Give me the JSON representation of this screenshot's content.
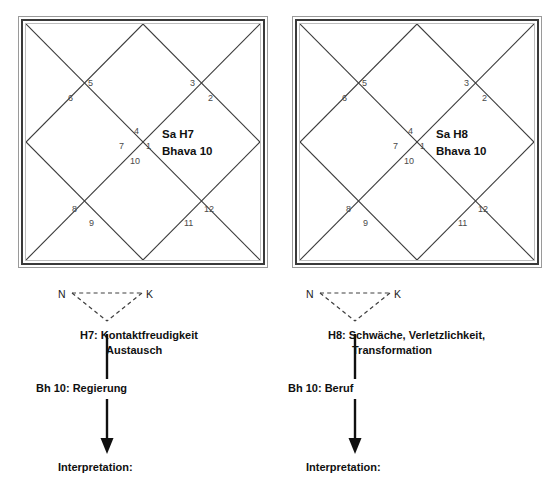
{
  "charts": [
    {
      "id": "chart-sa-h7",
      "planet_line1": "Sa H7",
      "planet_line2": "Bhava 10",
      "house_numbers": {
        "top_center_upper": "4",
        "center_left": "7",
        "center_right": "1",
        "center_lower": "10",
        "upper_left_inner": "5",
        "upper_left_outer": "6",
        "upper_right_inner": "3",
        "upper_right_outer": "2",
        "lower_left_outer": "8",
        "lower_left_inner": "9",
        "lower_right_inner": "11",
        "lower_right_outer": "12"
      }
    },
    {
      "id": "chart-sa-h8",
      "planet_line1": "Sa H8",
      "planet_line2": "Bhava 10",
      "house_numbers": {
        "top_center_upper": "4",
        "center_left": "7",
        "center_right": "1",
        "center_lower": "10",
        "upper_left_inner": "5",
        "upper_left_outer": "6",
        "upper_right_inner": "3",
        "upper_right_outer": "2",
        "lower_left_outer": "8",
        "lower_left_inner": "9",
        "lower_right_inner": "11",
        "lower_right_outer": "12"
      }
    }
  ],
  "flows": [
    {
      "id": "flow-h7",
      "node_left": "N",
      "node_right": "K",
      "house_line1": "H7: Kontaktfreudigkeit",
      "house_line2": "Austausch",
      "bhava": "Bh 10: Regierung",
      "interpretation": "Interpretation:"
    },
    {
      "id": "flow-h8",
      "node_left": "N",
      "node_right": "K",
      "house_line1": "H8: Schwäche, Verletzlichkeit,",
      "house_line2": "Transformation",
      "bhava": "Bh 10: Beruf",
      "interpretation": "Interpretation:"
    }
  ],
  "colors": {
    "line": "#3a3a3a",
    "frame_outer": "#9a9a9a",
    "frame_inner": "#bdbdbd",
    "number": "#4a4a4a",
    "text": "#101010",
    "background": "#ffffff"
  }
}
